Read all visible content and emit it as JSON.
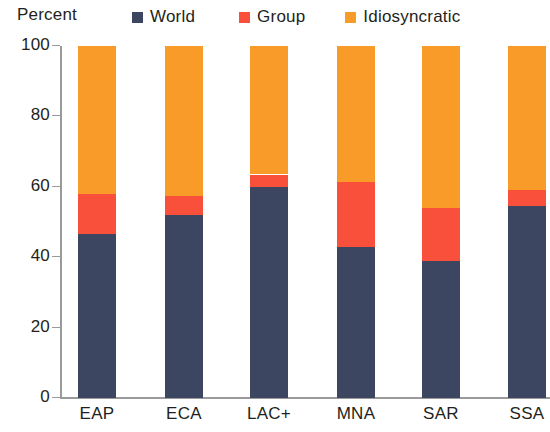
{
  "chart_data": {
    "type": "bar",
    "stacked": true,
    "title": "",
    "subtitle": "",
    "xlabel": "",
    "ylabel": "Percent",
    "ylim": [
      0,
      100
    ],
    "yticks": [
      0,
      20,
      40,
      60,
      80,
      100
    ],
    "grid": false,
    "legend_position": "top",
    "categories": [
      "EAP",
      "ECA",
      "LAC+",
      "MNA",
      "SAR",
      "SSA"
    ],
    "series": [
      {
        "name": "World",
        "color": "#3d4661",
        "values": [
          46.5,
          52,
          60,
          43,
          39,
          54.5
        ]
      },
      {
        "name": "Group",
        "color": "#f9503c",
        "values": [
          11.5,
          5.5,
          3.5,
          18.5,
          15,
          4.5
        ]
      },
      {
        "name": "Idiosyncratic",
        "color": "#f89b28",
        "values": [
          42,
          42.5,
          36.5,
          38.5,
          46,
          41
        ]
      }
    ]
  },
  "axis": {
    "unit_label": "Percent",
    "y_tick_labels": [
      "100",
      "80",
      "60",
      "40",
      "20",
      "0"
    ],
    "x_tick_labels": [
      "EAP",
      "ECA",
      "LAC+",
      "MNA",
      "SAR",
      "SSA"
    ]
  },
  "legend": {
    "items": [
      {
        "label": "World",
        "color": "#3d4661"
      },
      {
        "label": "Group",
        "color": "#f9503c"
      },
      {
        "label": "Idiosyncratic",
        "color": "#f89b28"
      }
    ]
  }
}
